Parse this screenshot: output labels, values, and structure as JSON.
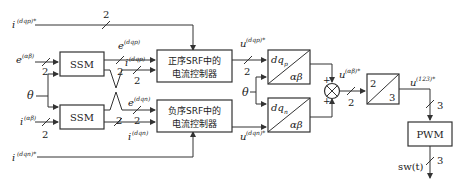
{
  "signals": {
    "i_dqp_ref": "i",
    "i_dqp_ref_sup": "(dqp)*",
    "i_dqn_ref": "i",
    "i_dqn_ref_sup": "(dqn)*",
    "e_ab": "e",
    "e_ab_sup": "(αβ)",
    "theta": "θ",
    "i_ab": "i",
    "i_ab_sup": "(αβ)",
    "e_dqp": "e",
    "e_dqp_sup": "(dqp)",
    "i_dqp": "i",
    "i_dqp_sup": "(dqp)",
    "e_dqn": "e",
    "e_dqn_sup": "(dqn)",
    "i_dqn": "i",
    "i_dqn_sup": "(dqn)",
    "u_dqp": "u",
    "u_dqp_sup": "(dqp)*",
    "u_dqn": "u",
    "u_dqn_sup": "(dqn)*",
    "theta2": "θ",
    "u_ab": "u",
    "u_ab_sup": "(αβ)*",
    "u_123": "u",
    "u_123_sup": "(123)*",
    "sw": "sw(t)"
  },
  "blocks": {
    "ssm_top": "SSM",
    "ssm_bottom": "SSM",
    "pos_ctrl_line1": "正序SRF中的",
    "pos_ctrl_line2": "电流控制器",
    "neg_ctrl_line1": "负序SRF中的",
    "neg_ctrl_line2": "电流控制器",
    "park_p_top": "dq",
    "park_p_sub": "p",
    "park_p_bottom": "αβ",
    "park_n_top": "dq",
    "park_n_sub": "n",
    "park_n_bottom": "αβ",
    "clarke_top": "2",
    "clarke_bottom": "3",
    "pwm": "PWM"
  },
  "bus_widths": {
    "two": "2",
    "three": "3"
  },
  "summing": {
    "plus_top": "+",
    "plus_bottom": "+"
  }
}
